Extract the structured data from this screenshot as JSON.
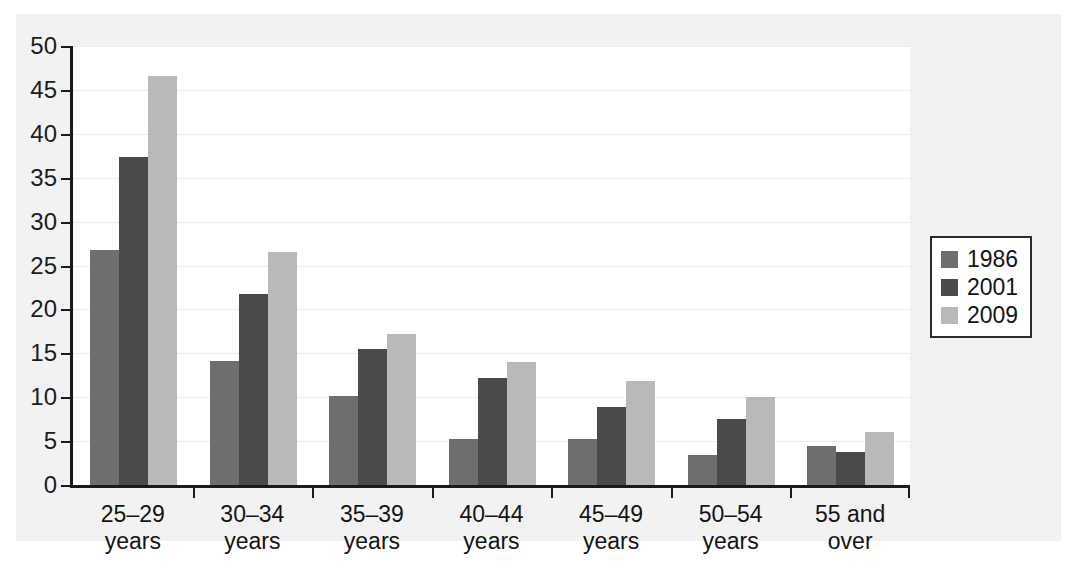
{
  "chart_data": {
    "type": "bar",
    "title": "",
    "subtitle": "",
    "xlabel": "",
    "ylabel": "",
    "ylim": [
      0,
      50
    ],
    "yticks": [
      0,
      5,
      10,
      15,
      20,
      25,
      30,
      35,
      40,
      45,
      50
    ],
    "ytick_labels": [
      "0",
      "5",
      "10",
      "15",
      "20",
      "25",
      "30",
      "35",
      "40",
      "45",
      "50"
    ],
    "grid": true,
    "grid_axis": "y",
    "legend_position": "right",
    "categories": [
      "25–29\nyears",
      "30–34\nyears",
      "35–39\nyears",
      "40–44\nyears",
      "45–49\nyears",
      "50–54\nyears",
      "55 and over"
    ],
    "series": [
      {
        "name": "1986",
        "color": "#6e6e6e",
        "values": [
          26.8,
          14.1,
          10.1,
          5.2,
          5.2,
          3.4,
          4.5
        ]
      },
      {
        "name": "2001",
        "color": "#4a4a4a",
        "values": [
          37.4,
          21.8,
          15.5,
          12.2,
          8.9,
          7.5,
          3.8
        ]
      },
      {
        "name": "2009",
        "color": "#b9b9b9",
        "values": [
          46.6,
          26.5,
          17.2,
          14.0,
          11.9,
          10.0,
          6.0
        ]
      }
    ]
  },
  "legend": {
    "items": [
      {
        "label": "1986",
        "color": "#6e6e6e"
      },
      {
        "label": "2001",
        "color": "#4a4a4a"
      },
      {
        "label": "2009",
        "color": "#b9b9b9"
      }
    ]
  },
  "colors": {
    "figure_background": "#f2f2f2",
    "plot_background": "#ffffff",
    "axis": "#1a1a1a",
    "gridline": "#ededed",
    "text": "#141414",
    "legend_border": "#2b2b2b"
  }
}
